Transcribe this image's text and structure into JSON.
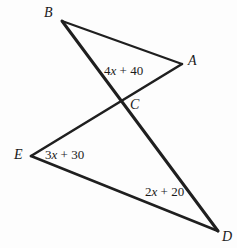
{
  "figure": {
    "background_color": "#fdfdfd",
    "stroke_color": "#1f1f1f",
    "vertices": [
      {
        "id": "B",
        "label": "B",
        "x": 62,
        "y": 21,
        "label_x": 44,
        "label_y": 6
      },
      {
        "id": "A",
        "label": "A",
        "x": 182,
        "y": 64,
        "label_x": 188,
        "label_y": 54
      },
      {
        "id": "C",
        "label": "C",
        "x": 122,
        "y": 103,
        "label_x": 130,
        "label_y": 98
      },
      {
        "id": "E",
        "label": "E",
        "x": 31,
        "y": 156,
        "label_x": 14,
        "label_y": 148
      },
      {
        "id": "D",
        "label": "D",
        "x": 218,
        "y": 231,
        "label_x": 222,
        "label_y": 230
      }
    ],
    "segments": [
      {
        "id": "BA",
        "from": "B",
        "to": "A",
        "width": 2.2
      },
      {
        "id": "BD",
        "from": "B",
        "to": "D",
        "width": 3.0
      },
      {
        "id": "AE",
        "from": "A",
        "to": "E",
        "width": 2.6
      },
      {
        "id": "ED",
        "from": "E",
        "to": "D",
        "width": 2.6
      }
    ],
    "expressions": [
      {
        "id": "angle-c",
        "coefficient": "4",
        "variable": "x",
        "operator": "+",
        "constant": "40",
        "text": "4x + 40",
        "x": 104,
        "y": 64
      },
      {
        "id": "angle-e",
        "coefficient": "3",
        "variable": "x",
        "operator": "+",
        "constant": "30",
        "text": "3x + 30",
        "x": 45,
        "y": 148
      },
      {
        "id": "angle-d",
        "coefficient": "2",
        "variable": "x",
        "operator": "+",
        "constant": "20",
        "text": "2x + 20",
        "x": 145,
        "y": 185
      }
    ]
  },
  "chart_data": {
    "type": "diagram",
    "points": {
      "A": [
        182,
        64
      ],
      "B": [
        62,
        21
      ],
      "C": [
        122,
        103
      ],
      "D": [
        218,
        231
      ],
      "E": [
        31,
        156
      ]
    },
    "edges": [
      [
        "B",
        "A"
      ],
      [
        "B",
        "D"
      ],
      [
        "A",
        "E"
      ],
      [
        "E",
        "D"
      ]
    ],
    "labels": [
      "4x + 40",
      "3x + 30",
      "2x + 20"
    ]
  }
}
